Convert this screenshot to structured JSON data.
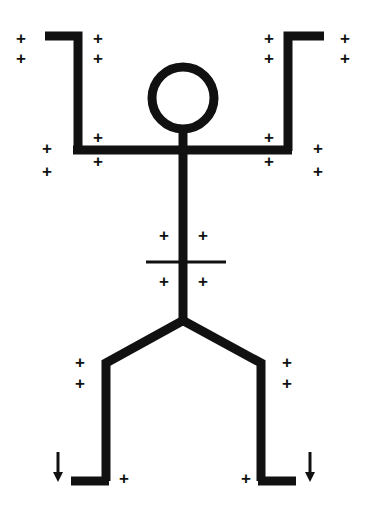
{
  "canvas": {
    "width": 365,
    "height": 515,
    "background_color": "#ffffff",
    "ink_color": "#111111"
  },
  "diagram": {
    "stroke_color": "#111111",
    "thick_stroke_width": 9,
    "thin_stroke_width": 3,
    "parts": [
      {
        "name": "head",
        "shape": "circle",
        "cx": 183,
        "cy": 98,
        "r": 31,
        "stroke_width": 9,
        "fill": "none"
      },
      {
        "name": "neck",
        "shape": "line",
        "points": "183,128 183,152",
        "stroke_width": 9
      },
      {
        "name": "left-arm",
        "shape": "polyline",
        "points": "45,36 78,36 78,150",
        "stroke_width": 9
      },
      {
        "name": "right-arm",
        "shape": "polyline",
        "points": "324,36 288,36 288,150",
        "stroke_width": 9
      },
      {
        "name": "shoulder-line",
        "shape": "line",
        "points": "74,150 291,150",
        "stroke_width": 9
      },
      {
        "name": "torso",
        "shape": "line",
        "points": "183,148 183,321",
        "stroke_width": 9
      },
      {
        "name": "waist-crossbar",
        "shape": "line",
        "points": "146,262 226,262",
        "stroke_width": 3
      },
      {
        "name": "left-leg",
        "shape": "polyline",
        "points": "183,320 106,363 106,481",
        "stroke_width": 9
      },
      {
        "name": "right-leg",
        "shape": "polyline",
        "points": "183,320 261,363 261,481",
        "stroke_width": 9
      },
      {
        "name": "left-foot",
        "shape": "line",
        "points": "72,481 108,481",
        "stroke_width": 9
      },
      {
        "name": "right-foot",
        "shape": "line",
        "points": "259,481 295,481",
        "stroke_width": 9
      }
    ]
  },
  "annotations": {
    "plus_symbol": "+",
    "plus_count": 20,
    "plus_marks": [
      {
        "id": "plus-upper-left-outer-top",
        "label": "+",
        "x": 21,
        "y": 38
      },
      {
        "id": "plus-upper-left-outer-bottom",
        "label": "+",
        "x": 21,
        "y": 58
      },
      {
        "id": "plus-upper-left-inner-top",
        "label": "+",
        "x": 98,
        "y": 38
      },
      {
        "id": "plus-upper-left-inner-bottom",
        "label": "+",
        "x": 98,
        "y": 58
      },
      {
        "id": "plus-upper-right-inner-top",
        "label": "+",
        "x": 269,
        "y": 38
      },
      {
        "id": "plus-upper-right-inner-bottom",
        "label": "+",
        "x": 269,
        "y": 58
      },
      {
        "id": "plus-upper-right-outer-top",
        "label": "+",
        "x": 345,
        "y": 38
      },
      {
        "id": "plus-upper-right-outer-bottom",
        "label": "+",
        "x": 345,
        "y": 58
      },
      {
        "id": "plus-shoulder-left-above",
        "label": "+",
        "x": 98,
        "y": 137
      },
      {
        "id": "plus-shoulder-left-below",
        "label": "+",
        "x": 98,
        "y": 161
      },
      {
        "id": "plus-shoulder-left-outer-top",
        "label": "+",
        "x": 47,
        "y": 148
      },
      {
        "id": "plus-shoulder-left-outer-bot",
        "label": "+",
        "x": 47,
        "y": 171
      },
      {
        "id": "plus-shoulder-right-above",
        "label": "+",
        "x": 269,
        "y": 137
      },
      {
        "id": "plus-shoulder-right-below",
        "label": "+",
        "x": 269,
        "y": 161
      },
      {
        "id": "plus-shoulder-right-outer-top",
        "label": "+",
        "x": 318,
        "y": 148
      },
      {
        "id": "plus-shoulder-right-outer-bot",
        "label": "+",
        "x": 318,
        "y": 171
      },
      {
        "id": "plus-waist-upper-left",
        "label": "+",
        "x": 164,
        "y": 235
      },
      {
        "id": "plus-waist-upper-right",
        "label": "+",
        "x": 203,
        "y": 235
      },
      {
        "id": "plus-waist-lower-left",
        "label": "+",
        "x": 164,
        "y": 281
      },
      {
        "id": "plus-waist-lower-right",
        "label": "+",
        "x": 203,
        "y": 281
      },
      {
        "id": "plus-leg-left-upper",
        "label": "+",
        "x": 80,
        "y": 362
      },
      {
        "id": "plus-leg-left-lower",
        "label": "+",
        "x": 80,
        "y": 383
      },
      {
        "id": "plus-leg-right-upper",
        "label": "+",
        "x": 287,
        "y": 362
      },
      {
        "id": "plus-leg-right-lower",
        "label": "+",
        "x": 287,
        "y": 383
      },
      {
        "id": "plus-foot-left",
        "label": "+",
        "x": 124,
        "y": 478
      },
      {
        "id": "plus-foot-right",
        "label": "+",
        "x": 246,
        "y": 478
      }
    ],
    "arrow_count": 2,
    "arrows": [
      {
        "id": "arrow-down-left",
        "direction": "down",
        "x": 58,
        "y": 467,
        "length": 30
      },
      {
        "id": "arrow-down-right",
        "direction": "down",
        "x": 310,
        "y": 467,
        "length": 30
      }
    ]
  }
}
